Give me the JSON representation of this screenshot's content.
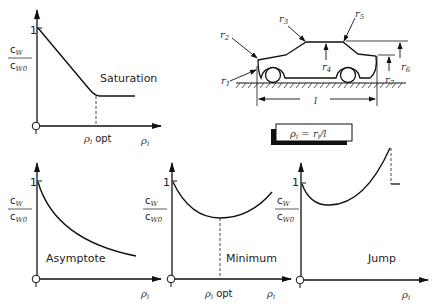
{
  "diagram": {
    "car_panel": {
      "radius_labels": [
        "r1",
        "r2",
        "r3",
        "r4",
        "r5",
        "r6",
        "r7"
      ],
      "length_label": "l",
      "formula_label": "ρi = ri / l"
    },
    "plots": [
      {
        "id": "saturation",
        "label": "Saturation",
        "y_tick": "1",
        "y_label_num": "cw",
        "y_label_den": "cw0",
        "x_label": "ρi",
        "x_marker": "ρi opt"
      },
      {
        "id": "asymptote",
        "label": "Asymptote",
        "y_tick": "1",
        "y_label_num": "cw",
        "y_label_den": "cw0",
        "x_label": "ρi"
      },
      {
        "id": "minimum",
        "label": "Minimum",
        "y_tick": "1",
        "y_label_num": "cw",
        "y_label_den": "cw0",
        "x_label": "ρi",
        "x_marker": "ρi opt"
      },
      {
        "id": "jump",
        "label": "Jump",
        "y_tick": "1",
        "y_label_num": "cw",
        "y_label_den": "cw0",
        "x_label": "ρi"
      }
    ]
  },
  "text": {
    "one": "1",
    "c": "c",
    "w": "W",
    "w0": "W0",
    "rho": "ρ",
    "i": "i",
    "opt": "opt",
    "saturation": "Saturation",
    "asymptote": "Asymptote",
    "minimum": "Minimum",
    "jump": "Jump",
    "l": "l",
    "formula": "ρi = ri/l",
    "r": "r",
    "n1": "1",
    "n2": "2",
    "n3": "3",
    "n4": "4",
    "n5": "5",
    "n6": "6",
    "n7": "7"
  }
}
